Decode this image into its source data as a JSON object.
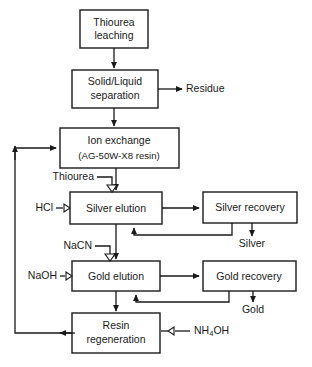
{
  "diagram": {
    "canvas": {
      "width": 312,
      "height": 367
    },
    "colors": {
      "line": "#1a1a1a",
      "box_fill": "#ffffff",
      "background": "#ffffff"
    },
    "boxes": [
      {
        "id": "thiourea_leaching",
        "lines": [
          "Thiourea",
          "leaching"
        ],
        "x": 80,
        "y": 10,
        "w": 68,
        "h": 38
      },
      {
        "id": "solid_liquid_separation",
        "lines": [
          "Solid/Liquid",
          "separation"
        ],
        "x": 72,
        "y": 70,
        "w": 86,
        "h": 38
      },
      {
        "id": "ion_exchange",
        "lines": [
          "Ion  exchange",
          "(AG-50W-X8 resin)"
        ],
        "x": 60,
        "y": 128,
        "w": 119,
        "h": 40
      },
      {
        "id": "silver_elution",
        "lines": [
          "Silver elution"
        ],
        "x": 70,
        "y": 192,
        "w": 92,
        "h": 32
      },
      {
        "id": "silver_recovery",
        "lines": [
          "Silver recovery"
        ],
        "x": 203,
        "y": 192,
        "w": 94,
        "h": 31
      },
      {
        "id": "gold_elution",
        "lines": [
          "Gold elution"
        ],
        "x": 72,
        "y": 261,
        "w": 88,
        "h": 30
      },
      {
        "id": "gold_recovery",
        "lines": [
          "Gold recovery"
        ],
        "x": 203,
        "y": 261,
        "w": 93,
        "h": 30
      },
      {
        "id": "resin_regeneration",
        "lines": [
          "Resin",
          "regeneration"
        ],
        "x": 72,
        "y": 313,
        "w": 88,
        "h": 40
      }
    ],
    "labels": [
      {
        "id": "residue",
        "text": "Residue",
        "x": 186,
        "y": 89,
        "anchor": "start"
      },
      {
        "id": "thiourea_reagent",
        "text": "Thiourea",
        "x": 94,
        "y": 181,
        "anchor": "end"
      },
      {
        "id": "hcl_reagent",
        "text": "HCl",
        "x": 52,
        "y": 208,
        "anchor": "end"
      },
      {
        "id": "nacn_reagent",
        "text": "NaCN",
        "x": 92,
        "y": 250,
        "anchor": "end"
      },
      {
        "id": "naoh_reagent",
        "text": "NaOH",
        "x": 56,
        "y": 276,
        "anchor": "end"
      },
      {
        "id": "silver_product",
        "text": "Silver",
        "x": 252,
        "y": 243,
        "anchor": "middle"
      },
      {
        "id": "gold_product",
        "text": "Gold",
        "x": 253,
        "y": 309,
        "anchor": "middle"
      }
    ],
    "formula_labels": [
      {
        "id": "nh4oh_reagent",
        "base1": "NH",
        "sub": "4",
        "base2": "OH",
        "x": 194,
        "y": 331,
        "anchor": "start"
      }
    ],
    "connectors": [
      {
        "id": "leaching-to-separation",
        "kind": "arrow-down"
      },
      {
        "id": "separation-to-residue",
        "kind": "arrow-right"
      },
      {
        "id": "separation-to-ion-exchange",
        "kind": "arrow-down"
      },
      {
        "id": "ion-exchange-to-silver-elution",
        "kind": "arrow-down"
      },
      {
        "id": "thiourea-feed",
        "kind": "valve-feed-down"
      },
      {
        "id": "hcl-feed",
        "kind": "valve-feed-right"
      },
      {
        "id": "silver-elution-to-silver-recovery",
        "kind": "arrow-right"
      },
      {
        "id": "silver-recovery-recycle",
        "kind": "loop-up"
      },
      {
        "id": "silver-recovery-to-silver",
        "kind": "arrow-down"
      },
      {
        "id": "silver-elution-to-gold-elution",
        "kind": "arrow-down"
      },
      {
        "id": "nacn-feed",
        "kind": "valve-feed-down"
      },
      {
        "id": "naoh-feed",
        "kind": "valve-feed-right"
      },
      {
        "id": "gold-elution-to-gold-recovery",
        "kind": "arrow-right"
      },
      {
        "id": "gold-recovery-recycle",
        "kind": "loop-up"
      },
      {
        "id": "gold-recovery-to-gold",
        "kind": "arrow-down"
      },
      {
        "id": "gold-elution-to-resin-regeneration",
        "kind": "arrow-down"
      },
      {
        "id": "nh4oh-feed",
        "kind": "valve-feed-left"
      },
      {
        "id": "resin-regeneration-to-ion-exchange",
        "kind": "recycle-loop-left"
      }
    ]
  }
}
